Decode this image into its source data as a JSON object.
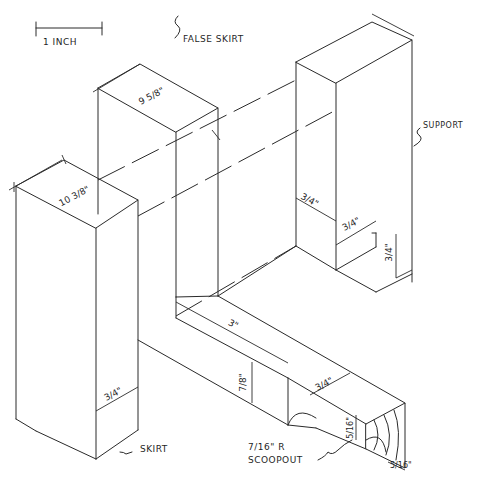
{
  "scale_bar": {
    "label": "1 INCH"
  },
  "labels": {
    "false_skirt": "FALSE SKIRT",
    "support": "SUPPORT",
    "skirt": "SKIRT",
    "scoopout_line1": "7/16\" R",
    "scoopout_line2": "SCOOPOUT"
  },
  "dimensions": {
    "skirt_length": "10 3/8\"",
    "false_skirt_length": "9 5/8\"",
    "skirt_thickness": "3/4\"",
    "support_notch_height": "3/4\"",
    "support_notch_depth": "3/4\"",
    "support_notch_width": "3/4\"",
    "leg_length": "3\"",
    "leg_height": "7/8\"",
    "leg_width": "3/4\"",
    "end_height": "5/16\"",
    "end_width": "5/16\"",
    "break_symbol": "~"
  }
}
